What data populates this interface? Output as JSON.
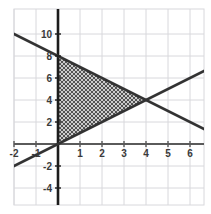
{
  "chart_data": {
    "type": "line",
    "title": "",
    "xlabel": "",
    "ylabel": "",
    "xlim": [
      -2.2,
      7.3
    ],
    "ylim": [
      -5.2,
      10.6
    ],
    "grid": true,
    "grid_color": "#d8d8dc",
    "axis_color": "#2b2b2b",
    "line_color": "#333333",
    "background": "#ffffff",
    "legend": "none",
    "xticks": [
      -2,
      -1,
      1,
      2,
      3,
      4,
      5,
      6,
      7
    ],
    "xtick_labels": [
      "-2",
      "-1",
      "1",
      "2",
      "3",
      "4",
      "5",
      "6",
      "7"
    ],
    "yticks": [
      10,
      8,
      6,
      4,
      2,
      -2,
      -4
    ],
    "ytick_labels": [
      "10",
      "8",
      "6",
      "4",
      "2",
      "-2",
      "-4"
    ],
    "series": [
      {
        "name": "descending-line",
        "equation": "y = -x + 8",
        "slope": -1,
        "intercept": 8,
        "x": [
          -2.2,
          7.3
        ],
        "y": [
          10.2,
          0.7
        ]
      },
      {
        "name": "ascending-line",
        "equation": "y = x",
        "slope": 1,
        "intercept": 0,
        "x": [
          -2.2,
          7.3
        ],
        "y": [
          -2.2,
          7.3
        ]
      }
    ],
    "annotations": [
      {
        "type": "shaded-region",
        "name": "hatched-triangle",
        "pattern": "cross-hatch",
        "vertices": [
          [
            0,
            0
          ],
          [
            0,
            8
          ],
          [
            4,
            4
          ]
        ]
      },
      {
        "type": "intersection-point",
        "name": "lines-intersection",
        "point": [
          4,
          4
        ]
      }
    ]
  },
  "labels": {
    "x_axis_name": "x-axis",
    "y_axis_name": "y-axis",
    "origin": "0"
  }
}
